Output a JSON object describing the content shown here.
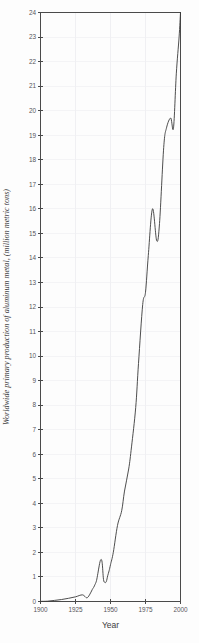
{
  "chart_data": {
    "type": "line",
    "title": "",
    "xlabel": "Year",
    "ylabel": "Worldwide primary production of aluminum metal, (million metric tons)",
    "xlim": [
      1900,
      2000
    ],
    "ylim": [
      0,
      24
    ],
    "grid": true,
    "legend_position": "none",
    "x_ticks": [
      1900,
      1925,
      1950,
      1975,
      2000
    ],
    "x_tick_labels": [
      "1900",
      "1925",
      "1950",
      "1975",
      "2000"
    ],
    "y_ticks": [
      0,
      1,
      2,
      3,
      4,
      5,
      6,
      7,
      8,
      9,
      10,
      11,
      12,
      13,
      14,
      15,
      16,
      17,
      18,
      19,
      20,
      21,
      22,
      23,
      24
    ],
    "y_tick_labels": [
      "0",
      "1",
      "2",
      "3",
      "4",
      "5",
      "6",
      "7",
      "8",
      "9",
      "10",
      "11",
      "12",
      "13",
      "14",
      "15",
      "16",
      "17",
      "18",
      "19",
      "20",
      "21",
      "22",
      "23",
      "24"
    ],
    "series": [
      {
        "name": "Worldwide primary aluminum production",
        "x": [
          1900,
          1905,
          1910,
          1915,
          1920,
          1925,
          1930,
          1933,
          1935,
          1937,
          1938,
          1939,
          1940,
          1941,
          1942,
          1943,
          1944,
          1945,
          1946,
          1947,
          1948,
          1949,
          1950,
          1952,
          1955,
          1958,
          1960,
          1963,
          1965,
          1968,
          1970,
          1973,
          1975,
          1977,
          1980,
          1983,
          1985,
          1988,
          1990,
          1993,
          1995,
          1997,
          1999,
          2000
        ],
        "y": [
          0.006,
          0.013,
          0.045,
          0.08,
          0.13,
          0.19,
          0.27,
          0.15,
          0.27,
          0.49,
          0.58,
          0.7,
          0.85,
          1.15,
          1.48,
          1.7,
          1.6,
          0.9,
          0.78,
          0.81,
          1.05,
          1.25,
          1.5,
          2.0,
          3.1,
          3.7,
          4.5,
          5.4,
          6.3,
          7.9,
          9.7,
          12.1,
          12.6,
          14.1,
          16.0,
          14.7,
          15.4,
          18.5,
          19.3,
          19.7,
          19.3,
          21.5,
          23.0,
          24.0
        ]
      }
    ]
  }
}
